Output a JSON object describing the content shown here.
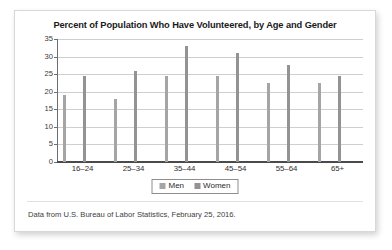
{
  "chart_data": {
    "type": "bar",
    "title": "Percent of Population Who Have Volunteered, by Age and Gender",
    "xlabel": "",
    "ylabel": "",
    "categories": [
      "16–24",
      "25–34",
      "35–44",
      "45–54",
      "55–64",
      "65+"
    ],
    "series": [
      {
        "name": "Men",
        "values": [
          19.0,
          18.0,
          24.5,
          24.5,
          22.5,
          22.5
        ],
        "color": "#a5a5a5"
      },
      {
        "name": "Women",
        "values": [
          24.5,
          26.0,
          33.0,
          31.0,
          27.5,
          24.5
        ],
        "color": "#939393"
      }
    ],
    "ylim": [
      0,
      35
    ],
    "yticks": [
      0,
      5,
      10,
      15,
      20,
      25,
      30,
      35
    ],
    "ytick_labels": [
      "0",
      "5",
      "10",
      "15",
      "20",
      "25",
      "30",
      "35"
    ],
    "grid": true,
    "legend_position": "bottom-center",
    "source_note": "Data from U.S. Bureau of Labor Statistics, February 25, 2016."
  }
}
